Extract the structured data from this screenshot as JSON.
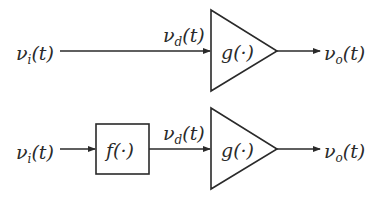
{
  "diagram": {
    "colors": {
      "stroke": "#2a2a2a",
      "background": "#ffffff"
    },
    "row1": {
      "input_label": "ν",
      "input_sub": "i",
      "input_arg": "(t)",
      "mid_label": "ν",
      "mid_sub": "d",
      "mid_arg": "(t)",
      "amp_label": "g(·)",
      "output_label": "ν",
      "output_sub": "o",
      "output_arg": "(t)"
    },
    "row2": {
      "input_label": "ν",
      "input_sub": "i",
      "input_arg": "(t)",
      "block_label": "f(·)",
      "mid_label": "ν",
      "mid_sub": "d",
      "mid_arg": "(t)",
      "amp_label": "g(·)",
      "output_label": "ν",
      "output_sub": "o",
      "output_arg": "(t)"
    }
  }
}
